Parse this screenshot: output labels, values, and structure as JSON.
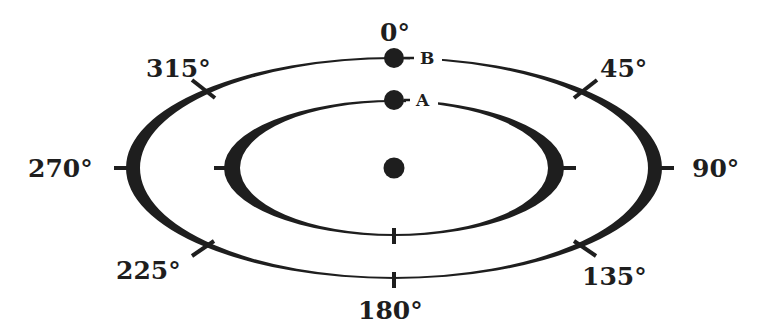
{
  "diagram": {
    "type": "orbit-ellipses",
    "colors": {
      "ink": "#1e1e1e",
      "background": "#ffffff"
    },
    "angle_labels": [
      {
        "id": "0",
        "text": "0°"
      },
      {
        "id": "45",
        "text": "45°"
      },
      {
        "id": "90",
        "text": "90°"
      },
      {
        "id": "135",
        "text": "135°"
      },
      {
        "id": "180",
        "text": "180°"
      },
      {
        "id": "225",
        "text": "225°"
      },
      {
        "id": "270",
        "text": "270°"
      },
      {
        "id": "315",
        "text": "315°"
      }
    ],
    "points": [
      {
        "id": "B",
        "text": "B",
        "orbit": "outer"
      },
      {
        "id": "A",
        "text": "A",
        "orbit": "inner"
      }
    ],
    "center_body": "central-dot"
  }
}
